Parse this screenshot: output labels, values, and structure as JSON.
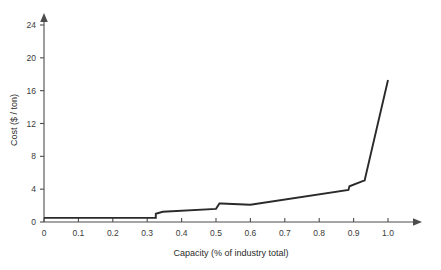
{
  "chart_data": {
    "type": "line",
    "title": "",
    "xlabel": "Capacity (% of industry total)",
    "ylabel": "Cost ($ / ton)",
    "xlim": [
      0,
      1.12
    ],
    "ylim": [
      0,
      25.5
    ],
    "xticks": [
      0,
      0.1,
      0.2,
      0.3,
      0.4,
      0.5,
      0.6,
      0.7,
      0.8,
      0.9,
      1.0
    ],
    "xticklabels": [
      "0",
      "0.1",
      "0.2",
      "0.3",
      "0.4",
      "0.5",
      "0.6",
      "0.7",
      "0.8",
      "0.9",
      "1.0"
    ],
    "yticks": [
      0,
      4,
      8,
      12,
      16,
      20,
      24
    ],
    "yticklabels": [
      "0",
      "4",
      "8",
      "12",
      "16",
      "20",
      "24"
    ],
    "grid": false,
    "legend": null,
    "series": [
      {
        "name": "industry supply curve",
        "color": "#2a2a2a",
        "x": [
          0.0,
          0.325,
          0.325,
          0.345,
          0.5,
          0.51,
          0.515,
          0.6,
          0.885,
          0.888,
          0.928,
          0.932,
          1.0
        ],
        "y": [
          0.5,
          0.5,
          1.0,
          1.25,
          1.6,
          2.25,
          2.25,
          2.1,
          3.9,
          4.35,
          5.0,
          5.05,
          17.3
        ]
      }
    ],
    "annotations": []
  },
  "axes": {
    "x_axis_name": "x-axis",
    "y_axis_name": "y-axis"
  }
}
